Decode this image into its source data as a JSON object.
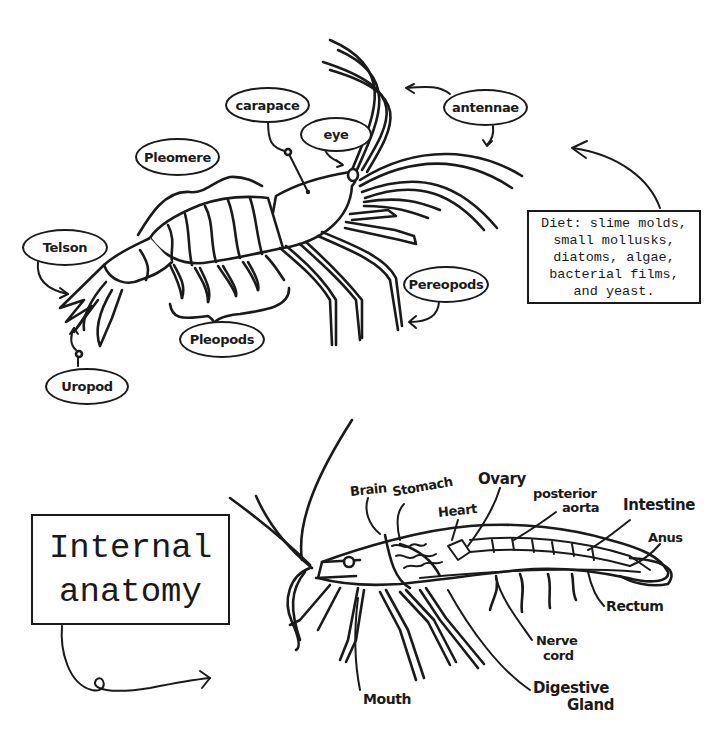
{
  "external_anatomy": {
    "labels": {
      "carapace": "carapace",
      "eye": "eye",
      "antennae": "antennae",
      "pleomere": "Pleomere",
      "telson": "Telson",
      "pereopods": "Pereopods",
      "pleopods": "Pleopods",
      "uropod": "Uropod"
    },
    "diet_box": {
      "lines": [
        "Diet: slime molds,",
        "small mollusks,",
        "diatoms, algae,",
        "bacterial films,",
        "and yeast."
      ]
    }
  },
  "internal_anatomy": {
    "title_lines": [
      "Internal",
      "anatomy"
    ],
    "labels": {
      "brain": "Brain",
      "stomach": "Stomach",
      "heart": "Heart",
      "ovary": "Ovary",
      "posterior_aorta_line1": "posterior",
      "posterior_aorta_line2": "aorta",
      "intestine": "Intestine",
      "anus": "Anus",
      "rectum": "Rectum",
      "nerve_cord_line1": "Nerve",
      "nerve_cord_line2": "cord",
      "digestive_gland_line1": "Digestive",
      "digestive_gland_line2": "Gland",
      "mouth": "Mouth"
    }
  },
  "colors": {
    "ink": "#1a1a1a",
    "background": "#ffffff"
  }
}
